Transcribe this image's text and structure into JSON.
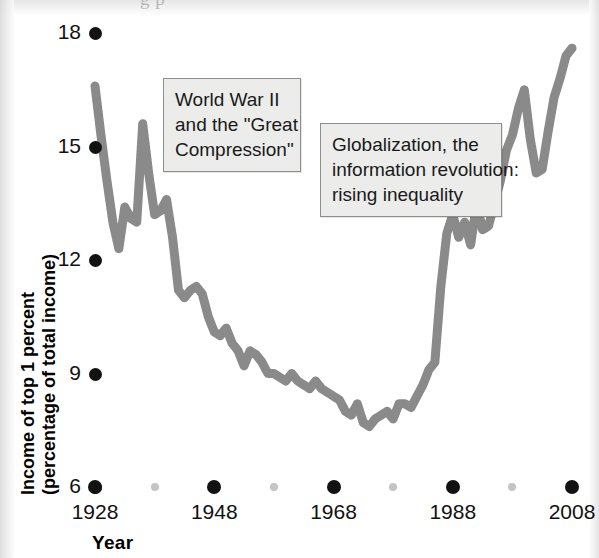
{
  "figure": {
    "background_color": "#ffffff",
    "line_color": "#8a8a8a",
    "tick_color": "#121212",
    "minor_tick_color": "#c4c4c4",
    "callout_fill": "#ececeb",
    "callout_border": "#8e8e8e",
    "ghost_text": "g    p"
  },
  "annotations": [
    {
      "id": "world-war-ii-callout",
      "lines": [
        "World War II",
        "and the \"Great",
        "Compression\""
      ],
      "x": 163,
      "y": 78,
      "w": 138,
      "h": 84
    },
    {
      "id": "globalization-callout",
      "lines": [
        "Globalization, the",
        "information revolution:",
        "rising inequality"
      ],
      "x": 320,
      "y": 123,
      "w": 182,
      "h": 82
    }
  ],
  "chart_data": {
    "type": "line",
    "title": "",
    "xlabel": "Year",
    "ylabel": "Income of top 1 percent (percentage of total income)",
    "ylabel_lines": [
      "Income of top 1 percent",
      "(percentage of total income)"
    ],
    "xlim": [
      1928,
      2008
    ],
    "ylim": [
      6,
      18
    ],
    "grid": false,
    "legend": null,
    "yticks": [
      6,
      9,
      12,
      15,
      18
    ],
    "ytick_labels": [
      "6",
      "9",
      "12",
      "15",
      "18"
    ],
    "xticks": [
      1928,
      1948,
      1968,
      1988,
      2008
    ],
    "xtick_labels": [
      "1928",
      "1948",
      "1968",
      "1988",
      "2008"
    ],
    "xticks_minor": [
      1938,
      1958,
      1978,
      1998
    ],
    "series": [
      {
        "name": "Income share of top 1 percent",
        "color": "#8a8a8a",
        "x": [
          1928,
          1929,
          1930,
          1931,
          1932,
          1933,
          1934,
          1935,
          1936,
          1937,
          1938,
          1939,
          1940,
          1941,
          1942,
          1943,
          1944,
          1945,
          1946,
          1947,
          1948,
          1949,
          1950,
          1951,
          1952,
          1953,
          1954,
          1955,
          1956,
          1957,
          1958,
          1959,
          1960,
          1961,
          1962,
          1963,
          1964,
          1965,
          1966,
          1967,
          1968,
          1969,
          1970,
          1971,
          1972,
          1973,
          1974,
          1975,
          1976,
          1977,
          1978,
          1979,
          1980,
          1981,
          1982,
          1983,
          1984,
          1985,
          1986,
          1987,
          1988,
          1989,
          1990,
          1991,
          1992,
          1993,
          1994,
          1995,
          1996,
          1997,
          1998,
          1999,
          2000,
          2001,
          2002,
          2003,
          2004,
          2005,
          2006,
          2007,
          2008
        ],
        "y": [
          16.6,
          15.3,
          14.1,
          13.0,
          12.3,
          13.4,
          13.1,
          13.0,
          15.6,
          14.3,
          13.2,
          13.3,
          13.6,
          12.6,
          11.2,
          11.0,
          11.2,
          11.3,
          11.1,
          10.5,
          10.1,
          10.0,
          10.2,
          9.8,
          9.6,
          9.2,
          9.6,
          9.5,
          9.3,
          9.0,
          9.0,
          8.9,
          8.8,
          9.0,
          8.8,
          8.7,
          8.6,
          8.8,
          8.6,
          8.5,
          8.4,
          8.3,
          8.0,
          7.9,
          8.2,
          7.7,
          7.6,
          7.8,
          7.9,
          8.0,
          7.8,
          8.2,
          8.2,
          8.1,
          8.4,
          8.7,
          9.1,
          9.3,
          11.3,
          12.7,
          13.2,
          12.6,
          13.0,
          12.4,
          13.5,
          12.8,
          12.9,
          13.5,
          14.1,
          14.9,
          15.3,
          16.0,
          16.5,
          15.2,
          14.3,
          14.4,
          15.4,
          16.3,
          16.8,
          17.4,
          17.6
        ]
      }
    ]
  }
}
